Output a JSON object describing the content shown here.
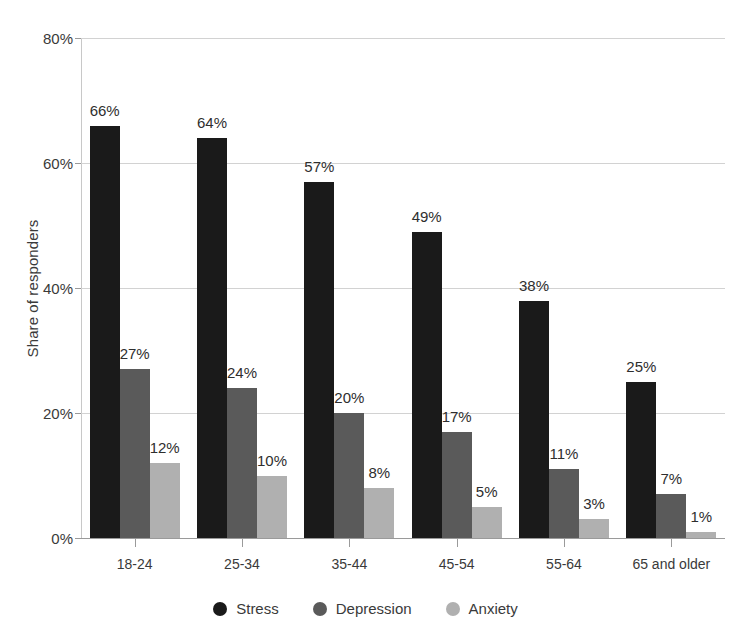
{
  "chart_data": {
    "type": "bar",
    "title": "",
    "subtitle": "",
    "xlabel": "",
    "ylabel": "Share of responders",
    "ylim": [
      0,
      80
    ],
    "y_tick_labels": [
      "0%",
      "20%",
      "40%",
      "60%",
      "80%"
    ],
    "y_ticks": [
      0,
      20,
      40,
      60,
      80
    ],
    "grid": true,
    "legend_position": "bottom",
    "value_suffix": "%",
    "categories": [
      "18-24",
      "25-34",
      "35-44",
      "45-54",
      "55-64",
      "65 and older"
    ],
    "series": [
      {
        "name": "Stress",
        "color": "#1a1a1a",
        "values": [
          66,
          64,
          57,
          49,
          38,
          25
        ],
        "labels": [
          "66%",
          "64%",
          "57%",
          "49%",
          "38%",
          "25%"
        ]
      },
      {
        "name": "Depression",
        "color": "#5a5a5a",
        "values": [
          27,
          24,
          20,
          17,
          11,
          7
        ],
        "labels": [
          "27%",
          "24%",
          "20%",
          "17%",
          "11%",
          "7%"
        ]
      },
      {
        "name": "Anxiety",
        "color": "#b0b0b0",
        "values": [
          12,
          10,
          8,
          5,
          3,
          1
        ],
        "labels": [
          "12%",
          "10%",
          "8%",
          "5%",
          "3%",
          "1%"
        ]
      }
    ]
  },
  "colors": {
    "background": "#ffffff",
    "gridline": "#d2d2d2",
    "axis": "#9a9a9a",
    "text": "#3a3a3a",
    "stress": "#1a1a1a",
    "depression": "#5a5a5a",
    "anxiety": "#b0b0b0"
  }
}
